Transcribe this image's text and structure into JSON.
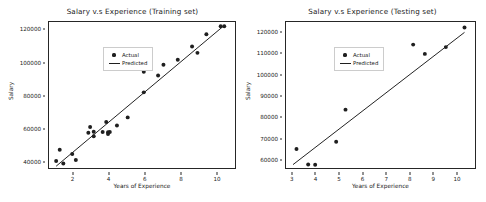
{
  "figure": {
    "background_color": "#ffffff",
    "point_color": "#1f1f1f",
    "line_color": "#1f1f1f"
  },
  "chart_data": [
    {
      "type": "scatter",
      "title": "Salary v.s Experience (Training set)",
      "xlabel": "Years of Experience",
      "ylabel": "Salary",
      "xlim": [
        0.7,
        11.1
      ],
      "ylim": [
        35000,
        124500
      ],
      "xticks": [
        2,
        4,
        6,
        8,
        10
      ],
      "yticks": [
        40000,
        60000,
        80000,
        100000,
        120000
      ],
      "grid": false,
      "legend_position": "upper left",
      "series": [
        {
          "name": "Actual",
          "marker": "circle",
          "x": [
            1.1,
            1.3,
            1.5,
            2.0,
            2.2,
            2.9,
            3.0,
            3.2,
            3.2,
            3.7,
            3.9,
            4.0,
            4.0,
            4.1,
            4.5,
            5.1,
            6.0,
            6.0,
            6.8,
            7.1,
            7.9,
            8.7,
            9.0,
            9.5,
            10.3,
            10.5
          ],
          "y": [
            39343,
            46205,
            37731,
            43525,
            39891,
            56642,
            60150,
            54445,
            57189,
            57081,
            63218,
            55794,
            56957,
            57081,
            61111,
            66029,
            93940,
            81363,
            91738,
            98273,
            101302,
            109431,
            105582,
            116969,
            121872,
            121872
          ]
        },
        {
          "name": "Predicted",
          "marker": "line",
          "x": [
            1.1,
            10.5
          ],
          "y": [
            36100,
            122400
          ]
        }
      ]
    },
    {
      "type": "scatter",
      "title": "Salary v.s Experience (Testing set)",
      "xlabel": "Years of Experience",
      "ylabel": "Salary",
      "xlim": [
        2.75,
        10.85
      ],
      "ylim": [
        55500,
        124500
      ],
      "xticks": [
        3,
        4,
        5,
        6,
        7,
        8,
        9,
        10
      ],
      "yticks": [
        60000,
        70000,
        80000,
        90000,
        100000,
        110000,
        120000
      ],
      "grid": false,
      "legend_position": "upper left",
      "series": [
        {
          "name": "Actual",
          "marker": "circle",
          "x": [
            3.2,
            3.7,
            4.0,
            4.9,
            5.3,
            8.2,
            8.7,
            9.6,
            10.4
          ],
          "y": [
            64445,
            57189,
            57081,
            67938,
            83088,
            113812,
            109431,
            112635,
            121872
          ]
        },
        {
          "name": "Predicted",
          "marker": "line",
          "x": [
            3.05,
            10.4
          ],
          "y": [
            57100,
            119600
          ]
        }
      ]
    }
  ],
  "legend": {
    "items": [
      {
        "label": "Actual",
        "key": "marker-dot"
      },
      {
        "label": "Predicted",
        "key": "line-segment"
      }
    ]
  }
}
